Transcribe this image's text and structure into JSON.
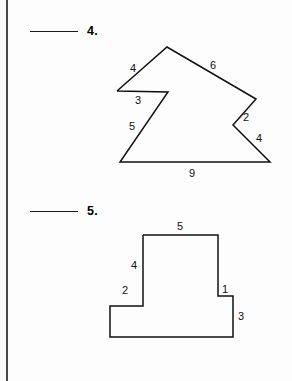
{
  "page": {
    "background_color": "#fdfdfd",
    "rule_color": "#4a4a4a",
    "ink_color": "#111111"
  },
  "problems": [
    {
      "number": "4.",
      "answer_blank": "",
      "figure": {
        "type": "polygon",
        "name": "concave-arrow-polygon",
        "vertices": [
          [
            117,
            91
          ],
          [
            167,
            47
          ],
          [
            256,
            99
          ],
          [
            233,
            125
          ],
          [
            270,
            162
          ],
          [
            120,
            162
          ],
          [
            168,
            92
          ],
          [
            117,
            91
          ]
        ],
        "side_labels": [
          {
            "text": "4",
            "x": 133,
            "y": 69
          },
          {
            "text": "6",
            "x": 213,
            "y": 66
          },
          {
            "text": "3",
            "x": 138,
            "y": 101
          },
          {
            "text": "2",
            "x": 246,
            "y": 118
          },
          {
            "text": "5",
            "x": 132,
            "y": 127
          },
          {
            "text": "4",
            "x": 259,
            "y": 139
          },
          {
            "text": "9",
            "x": 192,
            "y": 174
          }
        ]
      }
    },
    {
      "number": "5.",
      "answer_blank": "",
      "figure": {
        "type": "polygon",
        "name": "tee-shape-polygon",
        "vertices": [
          [
            143,
            235
          ],
          [
            218,
            235
          ],
          [
            218,
            296
          ],
          [
            233,
            296
          ],
          [
            233,
            337
          ],
          [
            110,
            337
          ],
          [
            110,
            306
          ],
          [
            143,
            306
          ],
          [
            143,
            235
          ]
        ],
        "side_labels": [
          {
            "text": "5",
            "x": 180,
            "y": 227
          },
          {
            "text": "4",
            "x": 134,
            "y": 266
          },
          {
            "text": "2",
            "x": 125,
            "y": 291
          },
          {
            "text": "1",
            "x": 225,
            "y": 290
          },
          {
            "text": "3",
            "x": 241,
            "y": 317
          }
        ]
      }
    }
  ]
}
